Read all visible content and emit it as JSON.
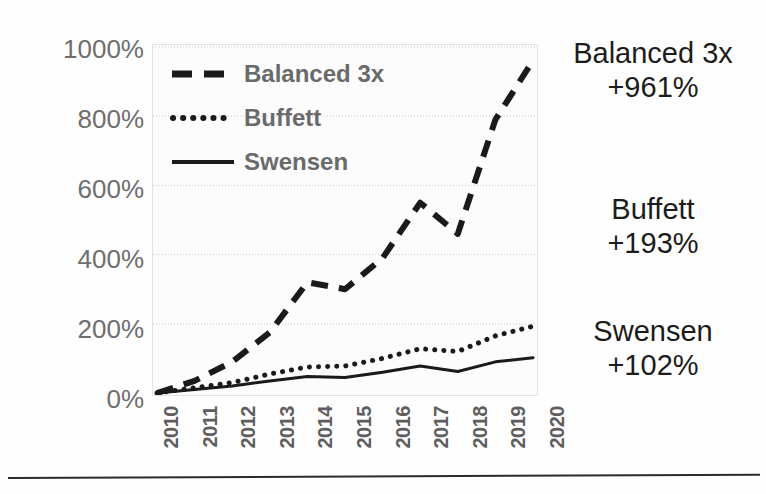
{
  "chart_data": {
    "type": "line",
    "title": "",
    "subtitle": "",
    "xlabel": "",
    "ylabel": "",
    "categories": [
      "2010",
      "2011",
      "2012",
      "2013",
      "2014",
      "2015",
      "2016",
      "2017",
      "2018",
      "2019",
      "2020"
    ],
    "x": [
      2010,
      2011,
      2012,
      2013,
      2014,
      2015,
      2016,
      2017,
      2018,
      2019,
      2020
    ],
    "ylim": [
      0,
      1000
    ],
    "xlim": [
      2010,
      2020
    ],
    "ytick_labels": [
      "1000%",
      "800%",
      "600%",
      "400%",
      "200%",
      "0%"
    ],
    "ytick_values": [
      1000,
      800,
      600,
      400,
      200,
      0
    ],
    "ytick_step": 200,
    "grid": true,
    "grid_axis": "y",
    "grid_style": "dotted",
    "legend_position": "top-left-inside",
    "series": [
      {
        "name": "Balanced 3x",
        "style": "dashed",
        "color": "#1a1a1a",
        "width": 6,
        "values": [
          0,
          35,
          90,
          175,
          320,
          300,
          390,
          550,
          460,
          790,
          961
        ],
        "final_label": "+961%"
      },
      {
        "name": "Buffett",
        "style": "dotted",
        "color": "#1a1a1a",
        "width": 5,
        "values": [
          0,
          15,
          30,
          55,
          75,
          78,
          100,
          128,
          120,
          165,
          193
        ],
        "final_label": "+193%"
      },
      {
        "name": "Swensen",
        "style": "solid",
        "color": "#1a1a1a",
        "width": 3,
        "values": [
          0,
          10,
          20,
          35,
          48,
          45,
          60,
          78,
          62,
          90,
          102
        ],
        "final_label": "+102%"
      }
    ]
  },
  "legend": {
    "items": [
      {
        "label": "Balanced 3x",
        "style": "dashed"
      },
      {
        "label": "Buffett",
        "style": "dotted"
      },
      {
        "label": "Swensen",
        "style": "solid"
      }
    ]
  },
  "annotations": [
    {
      "name": "Balanced 3x",
      "value": "+961%"
    },
    {
      "name": "Buffett",
      "value": "+193%"
    },
    {
      "name": "Swensen",
      "value": "+102%"
    }
  ],
  "colors": {
    "line": "#1a1a1a",
    "tick_text": "#6e6e6e",
    "legend_text": "#6a6a6a",
    "annotation_text": "#1c1c1c",
    "grid": "#c9c9c9",
    "plot_background": "#fcfcfc",
    "page_background": "#ffffff",
    "rule": "#2b2b2b"
  }
}
